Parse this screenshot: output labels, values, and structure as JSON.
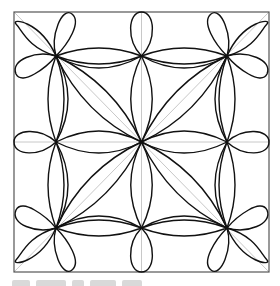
{
  "figure": {
    "frame": {
      "x": 14,
      "y": 12,
      "width": 255,
      "height": 260
    },
    "colors": {
      "background": "#ffffff",
      "stroke": "#111111",
      "guide": "#c8c8c8",
      "frame": "#555555"
    },
    "center": [
      141.5,
      142
    ],
    "quadrant_centers": [
      [
        56,
        56
      ],
      [
        227,
        56
      ],
      [
        56,
        228
      ],
      [
        227,
        228
      ]
    ],
    "guides": [
      "horizontal-midline",
      "vertical-midline",
      "diagonal-tl-br",
      "diagonal-tr-bl"
    ]
  },
  "caption": {
    "visible": "cropped, illegible text fragment at bottom edge"
  }
}
